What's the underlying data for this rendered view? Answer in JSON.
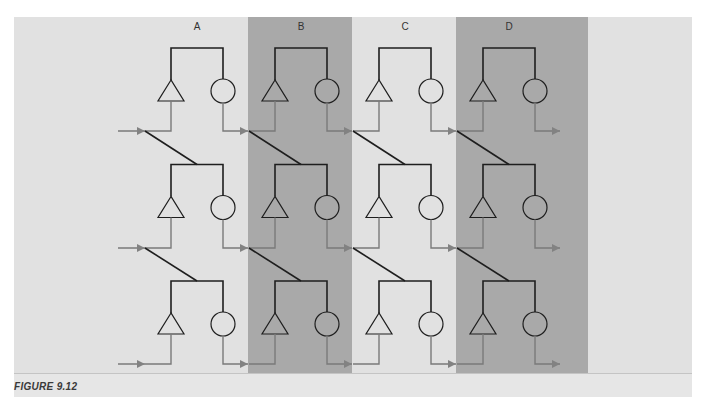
{
  "figure": {
    "caption": "FIGURE 9.12",
    "columns": [
      {
        "label": "A",
        "shaded": false
      },
      {
        "label": "B",
        "shaded": true
      },
      {
        "label": "C",
        "shaded": false
      },
      {
        "label": "D",
        "shaded": true
      }
    ],
    "rows": 3,
    "unit_components": [
      "triangle",
      "circle"
    ],
    "colors": {
      "background_light": "#e1e1e1",
      "background_shaded": "#a9a9a9",
      "wire_dark": "#1e1e1e",
      "wire_gray": "#7a7a7a",
      "arrow_gray": "#808080"
    }
  }
}
